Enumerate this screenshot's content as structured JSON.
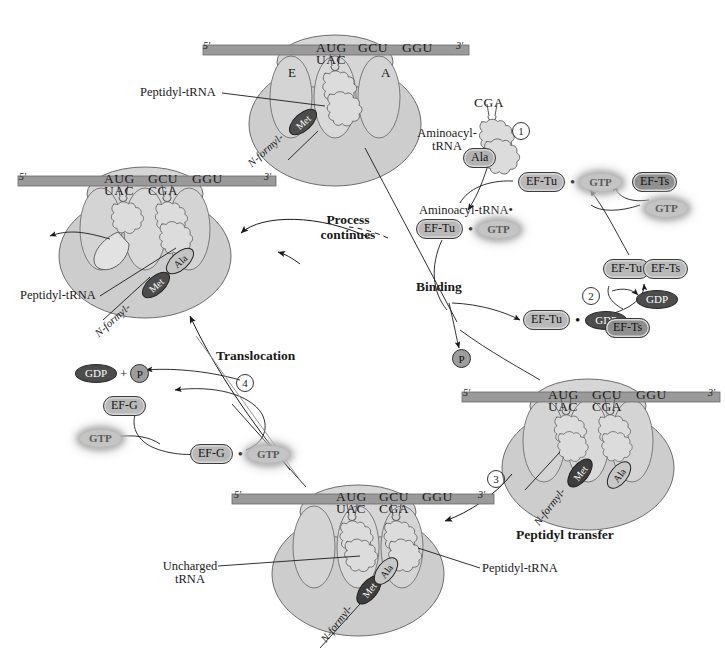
{
  "figure": {
    "type": "biology-process-diagram"
  },
  "colors": {
    "ribosome_body": "#c9c9c9",
    "ribosome_light": "#d7d7d7",
    "mrna_bar": "#9a9a9a",
    "pill_fill": "#b9b9b9",
    "dark_oval": "#4c4c4c",
    "glow_token": "#c4c4c4",
    "outline": "#333333",
    "text": "#1a1a1a"
  },
  "process_labels": {
    "binding": "Binding",
    "peptidyl_transfer": "Peptidyl transfer",
    "translocation": "Translocation",
    "process_continues_line1": "Process",
    "process_continues_line2": "continues"
  },
  "step_numbers": [
    "1",
    "2",
    "3",
    "4"
  ],
  "ribosomes": [
    {
      "id": "ribosome-top",
      "position": "top-center",
      "mrna": {
        "five_prime": "5′",
        "three_prime": "3′",
        "codons": [
          "AUG",
          "GCU",
          "GGU"
        ]
      },
      "anticodons": [
        "UAC"
      ],
      "sites": [
        "E",
        "A"
      ],
      "beads": [
        "N-formyl-",
        "Met"
      ],
      "callouts": [
        "Peptidyl-tRNA"
      ]
    },
    {
      "id": "ribosome-left",
      "position": "middle-left",
      "mrna": {
        "five_prime": "5′",
        "three_prime": "3′",
        "codons": [
          "AUG",
          "GCU",
          "GGU"
        ]
      },
      "anticodons": [
        "UAC",
        "CGA"
      ],
      "sites": [],
      "beads": [
        "N-formyl-",
        "Met",
        "Ala"
      ],
      "callouts": [
        "Peptidyl-tRNA"
      ]
    },
    {
      "id": "ribosome-right",
      "position": "middle-right",
      "mrna": {
        "five_prime": "5′",
        "three_prime": "3′",
        "codons": [
          "AUG",
          "GCU",
          "GGU"
        ]
      },
      "anticodons": [
        "UAC",
        "CGA"
      ],
      "sites": [],
      "beads": [
        "N-formyl-",
        "Met",
        "Ala"
      ],
      "callouts": []
    },
    {
      "id": "ribosome-bottom",
      "position": "bottom-center",
      "mrna": {
        "five_prime": "5′",
        "three_prime": "3′",
        "codons": [
          "AUG",
          "GCU",
          "GGU"
        ]
      },
      "anticodons": [
        "UAC",
        "CGA"
      ],
      "sites": [],
      "beads": [
        "N-formyl-",
        "Met",
        "Ala"
      ],
      "callouts": [
        "Uncharged tRNA",
        "Peptidyl-tRNA"
      ]
    }
  ],
  "aminoacyl_trna": {
    "anticodon": "CGA",
    "label_line1": "Aminoacyl-",
    "label_line2": "tRNA",
    "amino_acid": "Ala"
  },
  "ef_tu_cycle": {
    "complex_label_line1": "Aminoacyl-tRNA•",
    "tokens": {
      "ef_tu": "EF-Tu",
      "ef_ts": "EF-Ts",
      "gtp": "GTP",
      "gdp": "GDP",
      "phosphate": "P"
    },
    "nodes": [
      {
        "name": "ef-tu-gtp",
        "left": "EF-Tu",
        "right": "GTP",
        "sep": "•"
      },
      {
        "name": "aminoacyl-trna-ef-tu-gtp",
        "left": "EF-Tu",
        "right": "GTP",
        "sep": "•"
      },
      {
        "name": "ef-tu-gdp",
        "left": "EF-Tu",
        "right": "GDP",
        "sep": "•"
      },
      {
        "name": "ef-tu-ef-ts",
        "left": "EF-Tu",
        "right": "EF-Ts",
        "sep": ""
      }
    ],
    "free_ef_ts_top": "EF-Ts",
    "free_ef_ts_bottom": "EF-Ts",
    "free_gtp": "GTP",
    "released_gdp": "GDP",
    "released_phosphate": "P"
  },
  "ef_g_cycle": {
    "ef_g": "EF-G",
    "ef_g_gtp_left": "EF-G",
    "ef_g_gtp_right": "GTP",
    "sep": "•",
    "free_gtp": "GTP",
    "released_gdp": "GDP",
    "plus": "+",
    "released_phosphate": "P"
  },
  "callout_text": {
    "peptidyl_trna": "Peptidyl-tRNA",
    "uncharged_line1": "Uncharged",
    "uncharged_line2": "tRNA",
    "n_formyl": "N-formyl-",
    "met": "Met",
    "ala": "Ala",
    "site_e": "E",
    "site_a": "A"
  }
}
